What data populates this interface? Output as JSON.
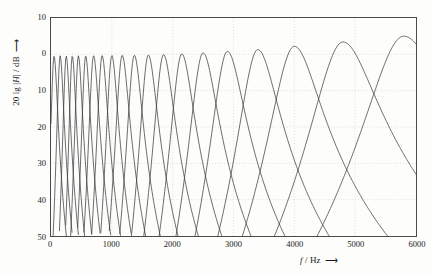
{
  "figure": {
    "background": "#fdfdfc",
    "frame_color": "#4a4a4a",
    "grid_color": "#c9c9c9",
    "curve_color": "#3a3a3a"
  },
  "axes": {
    "y_caption_prefix": "20 lg ",
    "y_caption_var": "H",
    "y_caption_suffix": " / dB",
    "y_caption_arrow": "⟶",
    "x_caption_var": "f",
    "x_caption_suffix": " / Hz",
    "x_caption_arrow": "⟶"
  },
  "chart_data": {
    "type": "line",
    "title": "",
    "subtitle": "",
    "xlabel": "f / Hz",
    "ylabel": "20 lg |H| / dB",
    "xlim": [
      0,
      6000
    ],
    "ylim": [
      -50,
      10
    ],
    "grid": true,
    "legend": "none",
    "xticks": [
      0,
      1000,
      2000,
      3000,
      4000,
      5000,
      6000
    ],
    "xtick_labels": [
      "0",
      "1000",
      "2000",
      "3000",
      "4000",
      "5000",
      "6000"
    ],
    "yticks": [
      10,
      0,
      -10,
      -20,
      -30,
      -40,
      -50
    ],
    "ytick_labels": [
      "10",
      "0",
      "10",
      "20",
      "30",
      "40",
      "50"
    ],
    "series": [
      {
        "name": "band-1",
        "center_hz": 50,
        "bandwidth_hz": 100,
        "peak_db": -0.4
      },
      {
        "name": "band-2",
        "center_hz": 150,
        "bandwidth_hz": 100,
        "peak_db": -0.4
      },
      {
        "name": "band-3",
        "center_hz": 250,
        "bandwidth_hz": 100,
        "peak_db": -0.4
      },
      {
        "name": "band-4",
        "center_hz": 350,
        "bandwidth_hz": 100,
        "peak_db": -0.4
      },
      {
        "name": "band-5",
        "center_hz": 450,
        "bandwidth_hz": 110,
        "peak_db": -0.4
      },
      {
        "name": "band-6",
        "center_hz": 570,
        "bandwidth_hz": 120,
        "peak_db": -0.4
      },
      {
        "name": "band-7",
        "center_hz": 700,
        "bandwidth_hz": 140,
        "peak_db": -0.35
      },
      {
        "name": "band-8",
        "center_hz": 840,
        "bandwidth_hz": 150,
        "peak_db": -0.35
      },
      {
        "name": "band-9",
        "center_hz": 1000,
        "bandwidth_hz": 160,
        "peak_db": -0.3
      },
      {
        "name": "band-10",
        "center_hz": 1170,
        "bandwidth_hz": 190,
        "peak_db": -0.3
      },
      {
        "name": "band-11",
        "center_hz": 1370,
        "bandwidth_hz": 210,
        "peak_db": -0.25
      },
      {
        "name": "band-12",
        "center_hz": 1600,
        "bandwidth_hz": 240,
        "peak_db": -0.2
      },
      {
        "name": "band-13",
        "center_hz": 1850,
        "bandwidth_hz": 280,
        "peak_db": -0.1
      },
      {
        "name": "band-14",
        "center_hz": 2150,
        "bandwidth_hz": 320,
        "peak_db": 0.1
      },
      {
        "name": "band-15",
        "center_hz": 2500,
        "bandwidth_hz": 380,
        "peak_db": 0.4
      },
      {
        "name": "band-16",
        "center_hz": 2900,
        "bandwidth_hz": 450,
        "peak_db": 0.8
      },
      {
        "name": "band-17",
        "center_hz": 3400,
        "bandwidth_hz": 550,
        "peak_db": 1.3
      },
      {
        "name": "band-18",
        "center_hz": 4000,
        "bandwidth_hz": 700,
        "peak_db": 2.2
      },
      {
        "name": "band-19",
        "center_hz": 4800,
        "bandwidth_hz": 900,
        "peak_db": 3.4
      },
      {
        "name": "band-20",
        "center_hz": 5800,
        "bandwidth_hz": 1100,
        "peak_db": 5.0
      }
    ]
  }
}
